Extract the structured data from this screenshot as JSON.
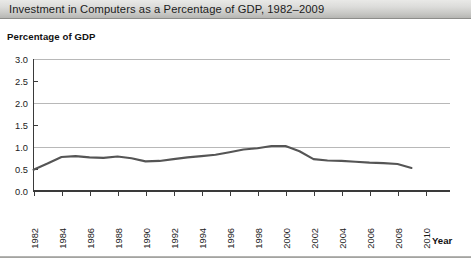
{
  "title": "Investment in Computers as a Percentage of GDP, 1982–2009",
  "axis": {
    "ylabel": "Percentage of GDP",
    "xlabel": "Year"
  },
  "colors": {
    "line": "#555555",
    "grid": "#b8b8b8",
    "axis": "#3a3a3a",
    "title_bar_top": "#e9e9e7",
    "title_bar_bottom": "#b6b6b3"
  },
  "chart_data": {
    "type": "line",
    "title": "Investment in Computers as a Percentage of GDP, 1982–2009",
    "xlabel": "Year",
    "ylabel": "Percentage of GDP",
    "grid": true,
    "legend": "none",
    "xlim": [
      1982,
      2010
    ],
    "ylim": [
      0.0,
      3.0
    ],
    "yticks": [
      "0.0",
      "0.5",
      "1.0",
      "1.5",
      "2.0",
      "2.5",
      "3.0"
    ],
    "ytick_values": [
      0.0,
      0.5,
      1.0,
      1.5,
      2.0,
      2.5,
      3.0
    ],
    "xticks": [
      "1982",
      "1984",
      "1986",
      "1988",
      "1990",
      "1992",
      "1994",
      "1996",
      "1998",
      "2000",
      "2002",
      "2004",
      "2006",
      "2008",
      "2010"
    ],
    "xtick_values": [
      1982,
      1984,
      1986,
      1988,
      1990,
      1992,
      1994,
      1996,
      1998,
      2000,
      2002,
      2004,
      2006,
      2008,
      2010
    ],
    "x": [
      1982,
      1983,
      1984,
      1985,
      1986,
      1987,
      1988,
      1989,
      1990,
      1991,
      1992,
      1993,
      1994,
      1995,
      1996,
      1997,
      1998,
      1999,
      2000,
      2001,
      2002,
      2003,
      2004,
      2005,
      2006,
      2007,
      2008,
      2009
    ],
    "values": [
      0.48,
      0.62,
      0.77,
      0.79,
      0.76,
      0.75,
      0.78,
      0.74,
      0.67,
      0.68,
      0.72,
      0.76,
      0.79,
      0.82,
      0.88,
      0.94,
      0.97,
      1.02,
      1.02,
      0.9,
      0.72,
      0.69,
      0.68,
      0.66,
      0.64,
      0.63,
      0.61,
      0.52
    ],
    "series": [
      {
        "name": "Investment in computers (% of GDP)",
        "values": [
          0.48,
          0.62,
          0.77,
          0.79,
          0.76,
          0.75,
          0.78,
          0.74,
          0.67,
          0.68,
          0.72,
          0.76,
          0.79,
          0.82,
          0.88,
          0.94,
          0.97,
          1.02,
          1.02,
          0.9,
          0.72,
          0.69,
          0.68,
          0.66,
          0.64,
          0.63,
          0.61,
          0.52
        ]
      }
    ]
  }
}
